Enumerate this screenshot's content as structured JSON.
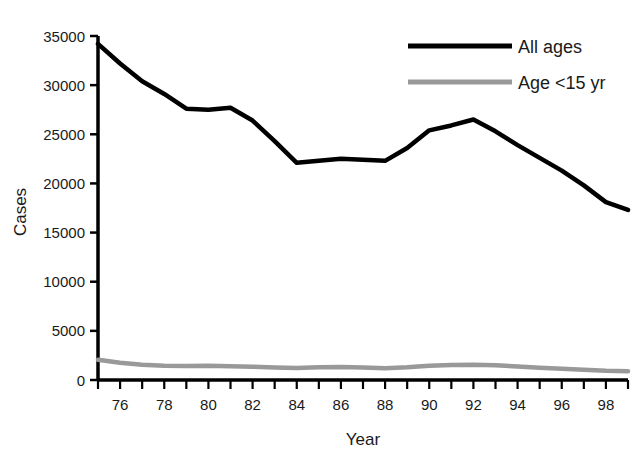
{
  "chart_data": {
    "type": "line",
    "title": "",
    "xlabel": "Year",
    "ylabel": "Cases",
    "xlim": [
      75,
      99
    ],
    "ylim": [
      0,
      35000
    ],
    "grid": false,
    "legend_position": "top-right",
    "x": [
      75,
      76,
      77,
      78,
      79,
      80,
      81,
      82,
      83,
      84,
      85,
      86,
      87,
      88,
      89,
      90,
      91,
      92,
      93,
      94,
      95,
      96,
      97,
      98,
      99
    ],
    "x_tick_labels": [
      "76",
      "78",
      "80",
      "82",
      "84",
      "86",
      "88",
      "90",
      "92",
      "94",
      "96",
      "98"
    ],
    "x_tick_values": [
      76,
      78,
      80,
      82,
      84,
      86,
      88,
      90,
      92,
      94,
      96,
      98
    ],
    "y_tick_labels": [
      "0",
      "5000",
      "10000",
      "15000",
      "20000",
      "25000",
      "30000",
      "35000"
    ],
    "y_tick_values": [
      0,
      5000,
      10000,
      15000,
      20000,
      25000,
      30000,
      35000
    ],
    "series": [
      {
        "name": "All ages",
        "color": "#000000",
        "values": [
          34200,
          32200,
          30400,
          29100,
          27600,
          27500,
          27700,
          26400,
          24300,
          22100,
          22300,
          22500,
          22400,
          22300,
          23600,
          25400,
          25900,
          26500,
          25300,
          23900,
          22600,
          21300,
          19800,
          18100,
          17300
        ]
      },
      {
        "name": "Age <15 yr",
        "color": "#999999",
        "values": [
          2050,
          1750,
          1550,
          1450,
          1420,
          1450,
          1400,
          1350,
          1280,
          1230,
          1300,
          1320,
          1260,
          1200,
          1300,
          1450,
          1520,
          1550,
          1500,
          1380,
          1250,
          1150,
          1050,
          950,
          900
        ]
      }
    ]
  },
  "legend": {
    "items": [
      {
        "label": "All ages",
        "color": "#000000"
      },
      {
        "label": "Age <15 yr",
        "color": "#999999"
      }
    ]
  }
}
